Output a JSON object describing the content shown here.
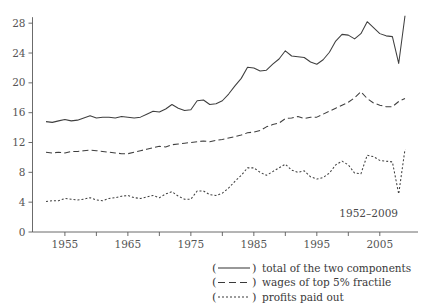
{
  "chart_data": {
    "type": "line",
    "title": "",
    "subtitle": "",
    "xlabel": "",
    "ylabel": "",
    "annotation": "1952–2009",
    "xlim": [
      1952,
      2009
    ],
    "ylim": [
      0,
      29.5
    ],
    "yticks": [
      0,
      4,
      8,
      12,
      16,
      20,
      24,
      28
    ],
    "ytick_labels": [
      "0",
      "4",
      "8",
      "12",
      "16",
      "20",
      "24",
      "28"
    ],
    "xticks": [
      1955,
      1960,
      1965,
      1970,
      1975,
      1980,
      1985,
      1990,
      1995,
      2000,
      2005
    ],
    "xtick_labels": [
      "1955",
      "",
      "1965",
      "",
      "1975",
      "",
      "1985",
      "",
      "1995",
      "",
      "2005"
    ],
    "xtick_labels_shown": [
      "1955",
      "1965",
      "1975",
      "1985",
      "1995",
      "2005"
    ],
    "grid": false,
    "legend_position": "below-right",
    "x": [
      1952,
      1953,
      1954,
      1955,
      1956,
      1957,
      1958,
      1959,
      1960,
      1961,
      1962,
      1963,
      1964,
      1965,
      1966,
      1967,
      1968,
      1969,
      1970,
      1971,
      1972,
      1973,
      1974,
      1975,
      1976,
      1977,
      1978,
      1979,
      1980,
      1981,
      1982,
      1983,
      1984,
      1985,
      1986,
      1987,
      1988,
      1989,
      1990,
      1991,
      1992,
      1993,
      1994,
      1995,
      1996,
      1997,
      1998,
      1999,
      2000,
      2001,
      2002,
      2003,
      2004,
      2005,
      2006,
      2007,
      2008,
      2009
    ],
    "series": [
      {
        "name": "total of the two components",
        "style": "solid",
        "legend_sample": "——",
        "values": [
          14.8,
          14.7,
          14.9,
          15.1,
          14.9,
          15.0,
          15.3,
          15.6,
          15.3,
          15.4,
          15.4,
          15.3,
          15.5,
          15.4,
          15.3,
          15.4,
          15.8,
          16.2,
          16.1,
          16.5,
          17.1,
          16.6,
          16.3,
          16.4,
          17.6,
          17.7,
          17.1,
          17.2,
          17.6,
          18.5,
          19.6,
          20.6,
          22.1,
          22.0,
          21.6,
          21.7,
          22.5,
          23.2,
          24.3,
          23.6,
          23.5,
          23.4,
          22.8,
          22.5,
          23.1,
          24.1,
          25.6,
          26.5,
          26.4,
          25.9,
          26.6,
          28.2,
          27.4,
          26.6,
          26.3,
          26.2,
          22.6,
          29.0
        ]
      },
      {
        "name": "wages of top 5% fractile",
        "style": "dashed",
        "legend_sample": "— —",
        "values": [
          10.7,
          10.6,
          10.7,
          10.6,
          10.8,
          10.8,
          10.9,
          11.0,
          10.9,
          10.8,
          10.7,
          10.6,
          10.5,
          10.5,
          10.7,
          10.9,
          11.1,
          11.3,
          11.5,
          11.4,
          11.7,
          11.8,
          11.9,
          12.0,
          12.1,
          12.2,
          12.1,
          12.3,
          12.4,
          12.6,
          12.8,
          13.0,
          13.3,
          13.4,
          13.6,
          14.1,
          14.4,
          14.6,
          15.2,
          15.3,
          15.5,
          15.2,
          15.4,
          15.4,
          15.8,
          16.2,
          16.6,
          17.0,
          17.4,
          18.0,
          18.8,
          17.9,
          17.3,
          17.0,
          16.8,
          16.8,
          17.5,
          17.9
        ]
      },
      {
        "name": "profits paid out",
        "style": "dotted",
        "legend_sample": "– – –",
        "values": [
          4.1,
          4.2,
          4.2,
          4.5,
          4.4,
          4.3,
          4.4,
          4.6,
          4.3,
          4.2,
          4.5,
          4.6,
          4.8,
          4.9,
          4.6,
          4.5,
          4.7,
          4.9,
          4.6,
          5.1,
          5.4,
          4.8,
          4.4,
          4.4,
          5.5,
          5.5,
          5.0,
          4.9,
          5.2,
          5.9,
          6.8,
          7.6,
          8.6,
          8.6,
          8.0,
          7.6,
          8.1,
          8.6,
          9.1,
          8.3,
          8.0,
          8.2,
          7.4,
          7.1,
          7.3,
          7.9,
          9.0,
          9.5,
          9.0,
          7.9,
          7.8,
          10.3,
          10.1,
          9.6,
          9.5,
          9.4,
          5.1,
          11.1
        ]
      }
    ]
  },
  "legend": {
    "entries": [
      {
        "sample": "solid",
        "label": "total of the two components"
      },
      {
        "sample": "dashed",
        "label": "wages of top 5% fractile"
      },
      {
        "sample": "dotted",
        "label": "profits paid out"
      }
    ],
    "open_paren": "(",
    "close_paren": ")"
  },
  "colors": {
    "background": "#ffffff",
    "line": "#3f3f3f",
    "axis": "#5a5a5a",
    "text": "#3a3a3a",
    "tick_text": "#555555"
  }
}
